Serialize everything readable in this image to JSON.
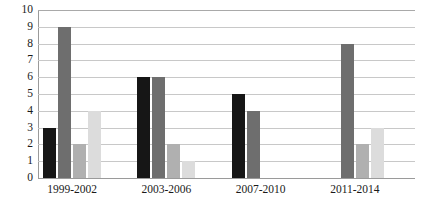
{
  "chart_data": {
    "type": "bar",
    "title": "",
    "subtitle": "",
    "xlabel": "",
    "ylabel": "",
    "categories": [
      "1999-2002",
      "2003-2006",
      "2007-2010",
      "2011-2014"
    ],
    "series": [
      {
        "name": "Series 1",
        "color": "#161616",
        "values": [
          3,
          9,
          2,
          4
        ]
      },
      {
        "name": "Series 2",
        "color": "#6e6e6e",
        "values": [
          6,
          6,
          2,
          1
        ]
      },
      {
        "name": "Series 3",
        "color": "#b0b0b0",
        "values": [
          5,
          4,
          0,
          0
        ]
      },
      {
        "name": "Series 4",
        "color": "#dcdcdc",
        "values": [
          0,
          8,
          2,
          3
        ]
      }
    ],
    "groups": [
      {
        "category": "1999-2002",
        "values": [
          3,
          9,
          2,
          4
        ]
      },
      {
        "category": "2003-2006",
        "values": [
          6,
          6,
          2,
          1
        ]
      },
      {
        "category": "2007-2010",
        "values": [
          5,
          4,
          0,
          0
        ]
      },
      {
        "category": "2011-2014",
        "values": [
          0,
          8,
          2,
          3
        ]
      }
    ],
    "ylim": [
      0,
      10
    ],
    "ytick_step": 1,
    "yticks": [
      0,
      1,
      2,
      3,
      4,
      5,
      6,
      7,
      8,
      9,
      10
    ],
    "ytick_labels": [
      "0",
      "1",
      "2",
      "3",
      "4",
      "5",
      "6",
      "7",
      "8",
      "9",
      "10"
    ],
    "grid": true,
    "grid_axis": "y",
    "legend": false,
    "legend_position": "none",
    "orientation": "vertical",
    "bar_colors": [
      "#161616",
      "#6e6e6e",
      "#b0b0b0",
      "#dcdcdc"
    ],
    "background_color": "#ffffff",
    "gridline_color": "#c8c8c8",
    "axis_color": "#9a9a9a",
    "text_color": "#1a1a1a"
  }
}
